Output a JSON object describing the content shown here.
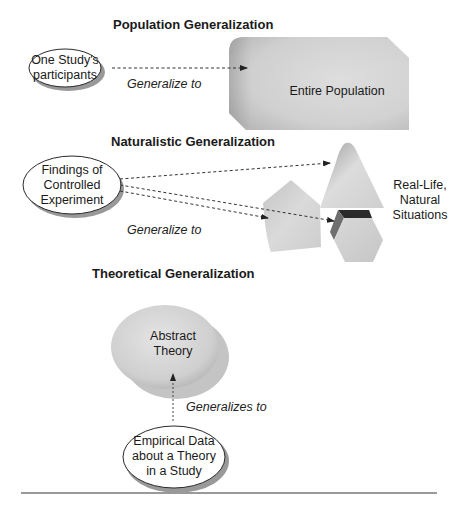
{
  "colors": {
    "shape_fill_light": "#e2e2e2",
    "shape_fill_dark": "#a8a8a8",
    "outline": "#2a2a2a",
    "arrow": "#333333",
    "rule": "#9a9a9a",
    "band_dark": "#2b2b2b"
  },
  "sections": {
    "population": {
      "heading": "Population Generalization",
      "source_lines": [
        "One Study's",
        "participants"
      ],
      "arrow_label": "Generalize to",
      "target_label": "Entire Population"
    },
    "naturalistic": {
      "heading": "Naturalistic Generalization",
      "source_lines": [
        "Findings of",
        "Controlled",
        "Experiment"
      ],
      "arrow_label": "Generalize to",
      "target_lines": [
        "Real-Life,",
        "Natural",
        "Situations"
      ]
    },
    "theoretical": {
      "heading": "Theoretical Generalization",
      "target_lines": [
        "Abstract",
        "Theory"
      ],
      "arrow_label": "Generalizes to",
      "source_lines": [
        "Empirical Data",
        "about a Theory",
        "in a Study"
      ]
    }
  }
}
